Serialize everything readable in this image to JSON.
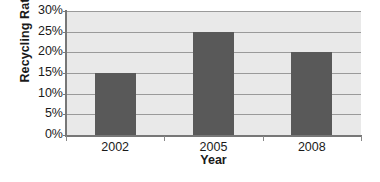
{
  "chart_data": {
    "type": "bar",
    "title": "",
    "subtitle": "",
    "categories": [
      "2002",
      "2005",
      "2008"
    ],
    "values": [
      15,
      25,
      20
    ],
    "value_labels": [
      "15%",
      "25%",
      "20%"
    ],
    "xlabel": "Year",
    "ylabel": "Recycling Rate",
    "ylim": [
      0,
      30
    ],
    "ytick_values": [
      0,
      5,
      10,
      15,
      20,
      25,
      30
    ],
    "ytick_labels": [
      "0%",
      "5%",
      "10%",
      "15%",
      "20%",
      "25%",
      "30%"
    ],
    "grid": true,
    "grid_axis": "y",
    "legend": false,
    "legend_position": "none",
    "bar_color": "#595959",
    "plot_background_color": "#e9e9e9",
    "gridline_color": "#9a9a9a",
    "axis_color": "#777777",
    "page_background_color": "#ffffff",
    "text_color": "#1a1a1a"
  }
}
